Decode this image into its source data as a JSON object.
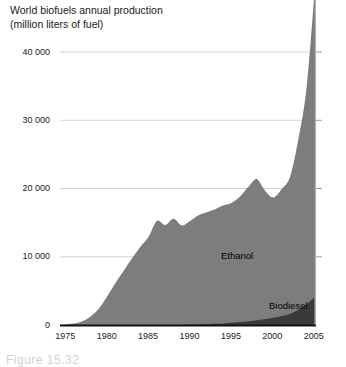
{
  "chart_data": {
    "type": "area",
    "title": "World biofuels annual production",
    "subtitle": "(million liters of fuel)",
    "xlabel": "",
    "ylabel": "",
    "stacked": true,
    "grid": true,
    "legend_position": "inline",
    "xlim": [
      1974,
      2005
    ],
    "ylim": [
      0,
      40000
    ],
    "y_ticks": [
      "0",
      "10 000",
      "20 000",
      "30 000",
      "40 000"
    ],
    "y_tick_values": [
      0,
      10000,
      20000,
      30000,
      40000
    ],
    "x_ticks": [
      "1975",
      "1980",
      "1985",
      "1990",
      "1995",
      "2000",
      "2005"
    ],
    "x_tick_values": [
      1975,
      1980,
      1985,
      1990,
      1995,
      2000,
      2005
    ],
    "x": [
      1974,
      1975,
      1976,
      1977,
      1978,
      1979,
      1980,
      1981,
      1982,
      1983,
      1984,
      1985,
      1986,
      1987,
      1988,
      1989,
      1990,
      1991,
      1992,
      1993,
      1994,
      1995,
      1996,
      1997,
      1998,
      1999,
      2000,
      2001,
      2002,
      2003,
      2004,
      2005
    ],
    "series": [
      {
        "name": "Ethanol",
        "color": "#7d7d7d",
        "values": [
          90,
          150,
          300,
          600,
          1300,
          2400,
          4200,
          6200,
          8000,
          9800,
          11500,
          13000,
          15300,
          14700,
          15600,
          14600,
          15200,
          16000,
          16400,
          16800,
          17300,
          17600,
          18400,
          19700,
          20700,
          18800,
          17600,
          18600,
          20100,
          25000,
          31900,
          45500
        ]
      },
      {
        "name": "Biodiesel",
        "color": "#3a3a3a",
        "values": [
          0,
          0,
          0,
          0,
          0,
          0,
          0,
          0,
          0,
          0,
          0,
          10,
          20,
          30,
          50,
          70,
          100,
          140,
          190,
          240,
          310,
          400,
          500,
          620,
          760,
          940,
          1150,
          1400,
          1700,
          2300,
          3100,
          4200
        ]
      }
    ]
  },
  "labels": {
    "ethanol": "Ethanol",
    "biodiesel": "Biodiesel"
  },
  "caption": {
    "text": "Figure 15.32"
  }
}
